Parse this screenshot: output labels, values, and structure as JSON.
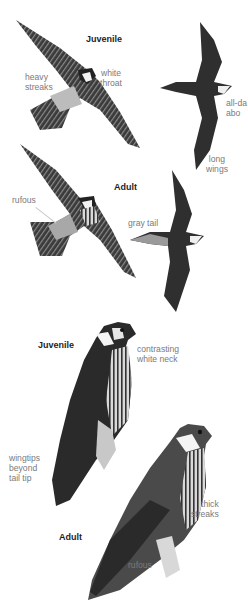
{
  "plate": {
    "subject": "falcon identification plate",
    "colors": {
      "background": "#ffffff",
      "heading": "#1e1e1e",
      "annotation": "#7a7a7a",
      "bird_dark": "#2a2a2a",
      "bird_mid": "#5a5a5a",
      "bird_light": "#bdbdbd"
    }
  },
  "flight": {
    "juvenile": {
      "heading": "Juvenile",
      "notes": {
        "streaks": "heavy\nstreaks",
        "throat": "white\nthroat"
      }
    },
    "juvenile_side": {
      "notes": {
        "above": "all-da\nabo",
        "wings": "long\nwings"
      }
    },
    "adult": {
      "heading": "Adult",
      "notes": {
        "rufous": "rufous",
        "tail": "gray tail"
      }
    }
  },
  "perched": {
    "juvenile": {
      "heading": "Juvenile",
      "notes": {
        "neck": "contrasting\nwhite neck",
        "wingtips": "wingtips\nbeyond\ntail tip"
      }
    },
    "adult": {
      "heading": "Adult",
      "notes": {
        "streaks": "thick\nstreaks",
        "rufous": "rufous"
      }
    }
  }
}
